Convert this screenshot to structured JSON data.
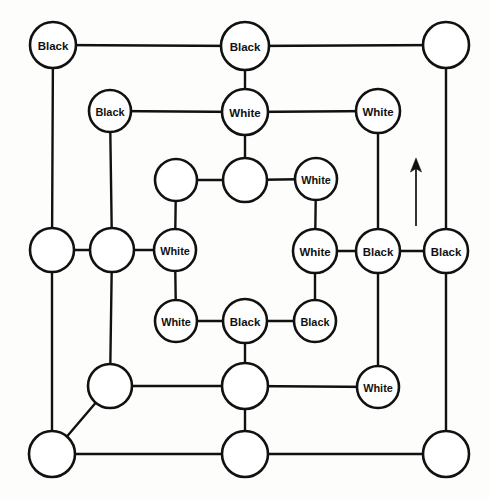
{
  "figure": {
    "name": "nested-cube-lattice-diagram",
    "width": 490,
    "height": 499,
    "background_color": "#fdfdfc",
    "stroke_color": "#111111",
    "node_fill_color": "#ffffff"
  },
  "legend": {
    "label_black": "Black",
    "label_white": "White",
    "label_blank": ""
  },
  "annotations": [
    {
      "name": "up-arrow",
      "type": "arrow",
      "direction": "up",
      "x": 416,
      "y_tail": 226,
      "y_head": 158
    }
  ],
  "nodes": [
    {
      "id": "n1",
      "label": "Black",
      "x": 53,
      "y": 45,
      "r": 23
    },
    {
      "id": "n2",
      "label": "Black",
      "x": 245,
      "y": 46,
      "r": 24
    },
    {
      "id": "n3",
      "label": "",
      "x": 446,
      "y": 45,
      "r": 23
    },
    {
      "id": "n4",
      "label": "Black",
      "x": 110,
      "y": 111,
      "r": 21
    },
    {
      "id": "n5",
      "label": "White",
      "x": 245,
      "y": 112,
      "r": 23
    },
    {
      "id": "n6",
      "label": "White",
      "x": 378,
      "y": 111,
      "r": 22
    },
    {
      "id": "n7",
      "label": "",
      "x": 176,
      "y": 180,
      "r": 21
    },
    {
      "id": "n8",
      "label": "",
      "x": 245,
      "y": 180,
      "r": 22
    },
    {
      "id": "n9",
      "label": "White",
      "x": 316,
      "y": 179,
      "r": 21
    },
    {
      "id": "n10",
      "label": "",
      "x": 52,
      "y": 250,
      "r": 22
    },
    {
      "id": "n11",
      "label": "",
      "x": 112,
      "y": 250,
      "r": 22
    },
    {
      "id": "n12",
      "label": "White",
      "x": 175,
      "y": 250,
      "r": 21
    },
    {
      "id": "n13",
      "label": "White",
      "x": 315,
      "y": 251,
      "r": 22
    },
    {
      "id": "n14",
      "label": "Black",
      "x": 378,
      "y": 251,
      "r": 22
    },
    {
      "id": "n15",
      "label": "Black",
      "x": 446,
      "y": 251,
      "r": 22
    },
    {
      "id": "n16",
      "label": "White",
      "x": 176,
      "y": 321,
      "r": 21
    },
    {
      "id": "n17",
      "label": "Black",
      "x": 245,
      "y": 321,
      "r": 22
    },
    {
      "id": "n18",
      "label": "Black",
      "x": 315,
      "y": 321,
      "r": 21
    },
    {
      "id": "n19",
      "label": "",
      "x": 110,
      "y": 386,
      "r": 22
    },
    {
      "id": "n20",
      "label": "",
      "x": 245,
      "y": 386,
      "r": 23
    },
    {
      "id": "n21",
      "label": "White",
      "x": 378,
      "y": 387,
      "r": 21
    },
    {
      "id": "n22",
      "label": "",
      "x": 52,
      "y": 454,
      "r": 23
    },
    {
      "id": "n23",
      "label": "",
      "x": 245,
      "y": 454,
      "r": 23
    },
    {
      "id": "n24",
      "label": "",
      "x": 446,
      "y": 454,
      "r": 23
    }
  ],
  "edges": [
    {
      "from": "n1",
      "to": "n2"
    },
    {
      "from": "n2",
      "to": "n3"
    },
    {
      "from": "n1",
      "to": "n10"
    },
    {
      "from": "n2",
      "to": "n5"
    },
    {
      "from": "n3",
      "to": "n15"
    },
    {
      "from": "n4",
      "to": "n5"
    },
    {
      "from": "n5",
      "to": "n6"
    },
    {
      "from": "n4",
      "to": "n11"
    },
    {
      "from": "n5",
      "to": "n8"
    },
    {
      "from": "n6",
      "to": "n14"
    },
    {
      "from": "n7",
      "to": "n8"
    },
    {
      "from": "n8",
      "to": "n9"
    },
    {
      "from": "n7",
      "to": "n12"
    },
    {
      "from": "n9",
      "to": "n13"
    },
    {
      "from": "n10",
      "to": "n11"
    },
    {
      "from": "n11",
      "to": "n12"
    },
    {
      "from": "n13",
      "to": "n14"
    },
    {
      "from": "n14",
      "to": "n15"
    },
    {
      "from": "n10",
      "to": "n22"
    },
    {
      "from": "n11",
      "to": "n19"
    },
    {
      "from": "n12",
      "to": "n16"
    },
    {
      "from": "n13",
      "to": "n18"
    },
    {
      "from": "n14",
      "to": "n21"
    },
    {
      "from": "n15",
      "to": "n24"
    },
    {
      "from": "n16",
      "to": "n17"
    },
    {
      "from": "n17",
      "to": "n18"
    },
    {
      "from": "n17",
      "to": "n20"
    },
    {
      "from": "n19",
      "to": "n20"
    },
    {
      "from": "n20",
      "to": "n21"
    },
    {
      "from": "n19",
      "to": "n22"
    },
    {
      "from": "n20",
      "to": "n23"
    },
    {
      "from": "n22",
      "to": "n23"
    },
    {
      "from": "n23",
      "to": "n24"
    }
  ]
}
